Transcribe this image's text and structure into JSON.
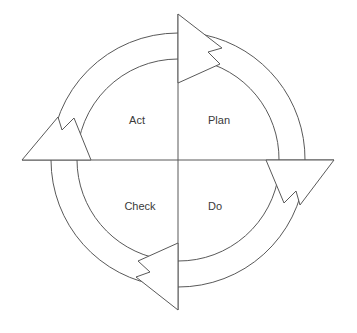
{
  "diagram": {
    "type": "cycle",
    "name": "PDCA Cycle",
    "center": {
      "x": 178,
      "y": 160
    },
    "radii": {
      "inner_arc": 101,
      "outer_arc": 127
    },
    "colors": {
      "stroke": "#595959",
      "fill": "#ffffff",
      "background": "#ffffff",
      "text": "#3a3a3a"
    },
    "quadrants": [
      {
        "id": "plan",
        "label": "Plan",
        "position": "top-right",
        "x": 218,
        "y": 119
      },
      {
        "id": "do",
        "label": "Do",
        "position": "bottom-right",
        "x": 214,
        "y": 205
      },
      {
        "id": "check",
        "label": "Check",
        "position": "bottom-left",
        "x": 140,
        "y": 205
      },
      {
        "id": "act",
        "label": "Act",
        "position": "top-left",
        "x": 137,
        "y": 119
      }
    ],
    "axes": {
      "vertical": {
        "x": 178,
        "y1": 14,
        "y2": 310
      },
      "horizontal": {
        "y": 160,
        "x1": 22,
        "x2": 334
      }
    },
    "arrows": [
      {
        "id": "arrow-top",
        "direction": "right",
        "meaning": "act-to-plan"
      },
      {
        "id": "arrow-right",
        "direction": "down",
        "meaning": "plan-to-do"
      },
      {
        "id": "arrow-bottom",
        "direction": "left",
        "meaning": "do-to-check"
      },
      {
        "id": "arrow-left",
        "direction": "up",
        "meaning": "check-to-act"
      }
    ]
  }
}
